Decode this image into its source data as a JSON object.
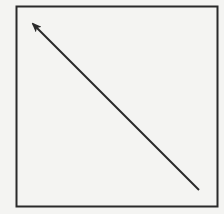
{
  "diagram": {
    "background": "#f4f4f2",
    "stroke_color": "#2a2a2a",
    "box": {
      "x": 16.5,
      "y": 6.5,
      "width": 201,
      "height": 200,
      "stroke_width": 2
    },
    "arrow": {
      "from": {
        "x": 199,
        "y": 190
      },
      "to": {
        "x": 33,
        "y": 24
      },
      "stroke_width": 2,
      "head": "arrow-pointing-up-left"
    }
  }
}
